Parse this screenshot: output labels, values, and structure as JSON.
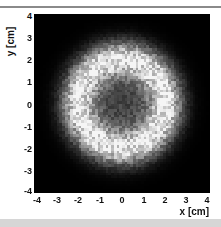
{
  "chart_data": {
    "type": "heatmap",
    "title": "",
    "xlabel": "x [cm]",
    "ylabel": "y [cm]",
    "xlim": [
      -4,
      4
    ],
    "ylim": [
      -4,
      4
    ],
    "x_ticks": [
      "-4",
      "-3",
      "-2",
      "-1",
      "0",
      "1",
      "2",
      "3",
      "4"
    ],
    "y_ticks": [
      "4",
      "3",
      "2",
      "1",
      "0",
      "-1",
      "-2",
      "-3",
      "-4"
    ],
    "colormap": "grayscale (black = low, white = high)",
    "grid": false,
    "legend": "none",
    "ring": {
      "center_x": 0,
      "center_y": 0,
      "peak_radius_cm": 2.0,
      "ring_width_sigma_cm": 0.55,
      "center_relative_intensity": 0.28,
      "peak_relative_intensity": 1.0,
      "outside_relative_intensity": 0.0
    },
    "bins": {
      "nx": 64,
      "ny": 64
    }
  }
}
